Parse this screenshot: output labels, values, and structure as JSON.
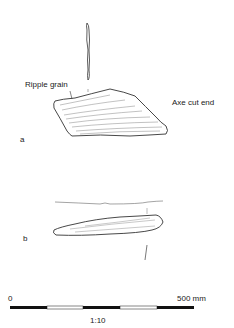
{
  "figure": {
    "view_a": {
      "label": "a",
      "annotations": {
        "ripple_grain": "Ripple grain",
        "axe_cut_end": "Axe cut end"
      }
    },
    "view_b": {
      "label": "b"
    },
    "scale_bar": {
      "start_label": "0",
      "end_label": "500 mm",
      "ratio": "1:10",
      "segments": [
        "black",
        "white",
        "black",
        "white",
        "black"
      ]
    }
  }
}
